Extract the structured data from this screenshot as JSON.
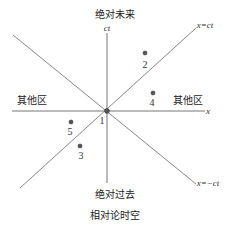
{
  "diagram": {
    "title": "相对论时空",
    "regions": {
      "absolute_future": "绝对未来",
      "absolute_past": "绝对过去",
      "elsewhere_left": "其他区",
      "elsewhere_right": "其他区"
    },
    "axes": {
      "x_label": "x",
      "ct_label": "ct"
    },
    "light_cone_lines": {
      "positive": "x=ct",
      "negative": "x=−ct"
    },
    "points": [
      {
        "id": "1",
        "label": "1"
      },
      {
        "id": "2",
        "label": "2"
      },
      {
        "id": "3",
        "label": "3"
      },
      {
        "id": "4",
        "label": "4"
      },
      {
        "id": "5",
        "label": "5"
      }
    ],
    "colors": {
      "line": "#888888",
      "text": "#222222",
      "point": "#555555"
    }
  }
}
